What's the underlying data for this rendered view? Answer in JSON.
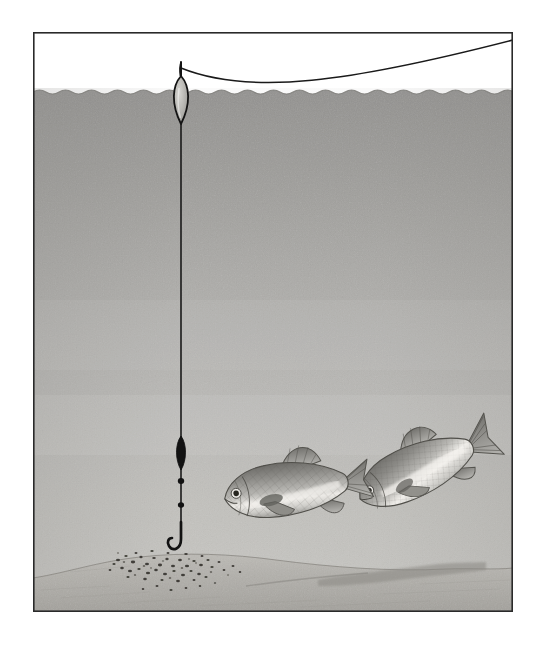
{
  "illustration": {
    "title": "Pole fishing rig with float above groundbait and two feeding fish",
    "caption": "",
    "canvas": {
      "width": 548,
      "height": 656
    },
    "frame": {
      "x": 33,
      "y": 32,
      "width": 480,
      "height": 580,
      "border_color": "#2a2a2a",
      "border_width": 1.6,
      "background_color": "#ffffff"
    },
    "palette": {
      "page_background": "#ffffff",
      "sky_above_water": "#ffffff",
      "water_top": "#9a9a9a",
      "water_mid": "#b4b3b1",
      "water_bottom": "#c9c8c5",
      "lakebed_light": "#b9b7b2",
      "lakebed_dark": "#8e8c87",
      "sediment_ridge": "#8a8883",
      "line_black": "#1a1a1a",
      "fish_body_light": "#e8e7e4",
      "fish_body_mid": "#a9a8a4",
      "fish_body_dark": "#6f6e6a",
      "bait_particle": "#3b3a37",
      "frame_border": "#2a2a2a"
    },
    "water": {
      "surface_y": 90,
      "wave_amplitude": 3,
      "wave_wavelength": 26,
      "label": "water surface"
    },
    "objects": [
      {
        "name": "fishing-line-aerial",
        "label": "Fishing line running from float up to the top-right of the frame",
        "path": "M 181 68 C 260 95 360 78 513 40",
        "stroke": "#1a1a1a",
        "stroke_width": 1.4
      },
      {
        "name": "float",
        "label": "Slim pole float with antenna above the surface and teardrop body below",
        "antenna_top_y": 62,
        "body_center": {
          "x": 181,
          "y": 100
        },
        "body_width": 16,
        "body_height": 48,
        "body_fill": "#b9b8b4",
        "outline": "#141414"
      },
      {
        "name": "main-line",
        "label": "Vertical main line from float down to the hook",
        "x": 181,
        "top_y": 124,
        "bottom_y": 537,
        "stroke": "#1a1a1a",
        "stroke_width": 1.5
      },
      {
        "name": "olivette-weight",
        "label": "Elongated bulk olivette weight on the line",
        "center": {
          "x": 181,
          "y": 453
        },
        "width": 11,
        "height": 34,
        "fill": "#141414"
      },
      {
        "name": "dropper-shot-1",
        "label": "Small dropper shot below the olivette",
        "center": {
          "x": 181,
          "y": 481
        },
        "radius": 3.1,
        "fill": "#141414"
      },
      {
        "name": "dropper-shot-2",
        "label": "Second small dropper shot",
        "center": {
          "x": 181,
          "y": 505
        },
        "radius": 3.0,
        "fill": "#141414"
      },
      {
        "name": "hook",
        "label": "J-shaped hook at the end of the line, just above the lakebed",
        "shank_top": {
          "x": 181,
          "y": 524
        },
        "bend_center": {
          "x": 175,
          "y": 543
        },
        "stroke": "#141414",
        "stroke_width": 2.6
      },
      {
        "name": "lakebed",
        "label": "Silty lakebed mound sloping across the bottom of the frame",
        "crest_y": 556,
        "left_y": 574,
        "right_y": 572
      },
      {
        "name": "sediment-ridge",
        "label": "Darker sediment ledge on the right side of the lakebed",
        "start": {
          "x": 330,
          "y": 576
        },
        "end": {
          "x": 470,
          "y": 565
        }
      },
      {
        "name": "groundbait-scatter",
        "label": "Scatter of dark groundbait particles on the bed beneath the hook",
        "center": {
          "x": 166,
          "y": 565
        },
        "spread_x": 70,
        "spread_y": 16,
        "particle_count": 96
      },
      {
        "name": "fish-front",
        "label": "Near fish swimming left, broadside, mouth toward the baited area",
        "head": {
          "x": 218,
          "y": 492
        },
        "tail": {
          "x": 355,
          "y": 470
        },
        "length": 140,
        "depth": 58,
        "orientation": "head-left",
        "eye": {
          "x": 232,
          "y": 489,
          "radius": 4.2
        }
      },
      {
        "name": "fish-rear",
        "label": "Far fish angled head-down toward the bed, tail raised to the upper right",
        "head": {
          "x": 345,
          "y": 522
        },
        "tail": {
          "x": 488,
          "y": 424
        },
        "length": 150,
        "depth": 54,
        "orientation": "head-down-left",
        "eye": {
          "x": 358,
          "y": 518,
          "radius": 3.8
        }
      }
    ]
  }
}
